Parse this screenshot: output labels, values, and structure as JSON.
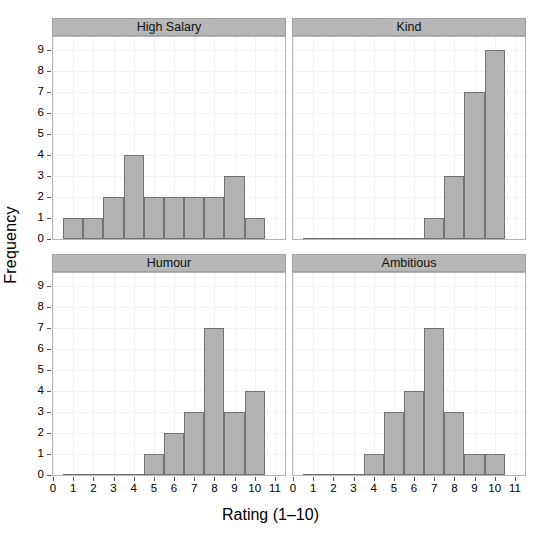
{
  "chart_data": {
    "type": "bar",
    "title": "",
    "xlabel": "Rating (1–10)",
    "ylabel": "Frequency",
    "xlim": [
      0,
      11.5
    ],
    "ylim": [
      0,
      9.6
    ],
    "grid": true,
    "layout": "2x2 faceted histograms",
    "x_ticks": [
      "0",
      "1",
      "2",
      "3",
      "4",
      "5",
      "6",
      "7",
      "8",
      "9",
      "10",
      "11"
    ],
    "y_ticks": [
      "0",
      "1",
      "2",
      "3",
      "4",
      "5",
      "6",
      "7",
      "8",
      "9"
    ],
    "bin_width": 1,
    "panels": [
      {
        "label": "High Salary",
        "position": "top-left",
        "categories": [
          1,
          2,
          3,
          4,
          5,
          6,
          7,
          8,
          9,
          10
        ],
        "values": [
          1,
          1,
          2,
          4,
          2,
          2,
          2,
          2,
          3,
          1
        ]
      },
      {
        "label": "Kind",
        "position": "top-right",
        "categories": [
          7,
          8,
          9,
          10
        ],
        "values": [
          1,
          3,
          7,
          9
        ]
      },
      {
        "label": "Humour",
        "position": "bottom-left",
        "categories": [
          5,
          6,
          7,
          8,
          9,
          10
        ],
        "values": [
          1,
          2,
          3,
          7,
          3,
          4
        ]
      },
      {
        "label": "Ambitious",
        "position": "bottom-right",
        "categories": [
          4,
          5,
          6,
          7,
          8,
          9,
          10
        ],
        "values": [
          1,
          3,
          4,
          7,
          3,
          1,
          1
        ]
      }
    ],
    "colors": {
      "bar_fill": "#b2b2b2",
      "bar_border": "#737373",
      "strip_background": "#b7b7b7",
      "panel_background": "#ffffff",
      "grid": "#f2f2f2",
      "axis_text": "#000000"
    }
  },
  "extra": {
    "last_salary_bar_note": "10",
    "top_artifact_text": ""
  }
}
